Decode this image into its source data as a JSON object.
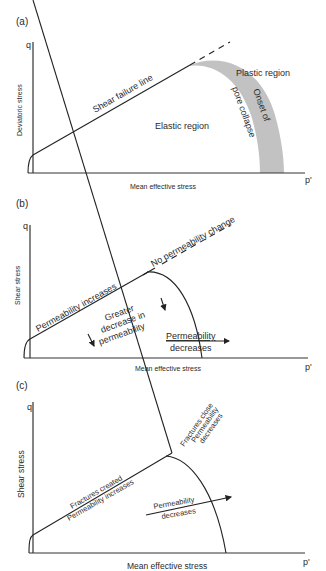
{
  "panels": [
    {
      "id": "a",
      "label": "(a)",
      "y_symbol": "q",
      "x_symbol": "p'",
      "y_title": "Deviatoric stress",
      "x_title": "Mean effective stress",
      "annotations": {
        "shear_line": "Shear failure line",
        "elastic": "Elastic region",
        "plastic": "Plastic region",
        "onset_1": "Onset of",
        "onset_2": "pore collapse"
      },
      "band_color": "#c2c2c2"
    },
    {
      "id": "b",
      "label": "(b)",
      "y_symbol": "q",
      "x_symbol": "p'",
      "y_title": "Shear stress",
      "x_title": "Mean effective stress",
      "annotations": {
        "shear_line": "Permeability increases",
        "dashed": "No permeability change",
        "greater_1": "Greater",
        "greater_2": "decrease in",
        "greater_3": "permeability",
        "perm_dec_1": "Permeability",
        "perm_dec_2": "decreases"
      }
    },
    {
      "id": "c",
      "label": "(c)",
      "y_symbol": "q",
      "x_symbol": "p'",
      "y_title": "Shear stress",
      "x_title": "Mean effective stress",
      "annotations": {
        "line_above": "Fractures created",
        "line_below": "Permeability increases",
        "close_1": "Fractures close",
        "close_2": "Permeability",
        "close_3": "decreases",
        "arrow_1": "Permeability",
        "arrow_2": "decreases"
      }
    }
  ]
}
